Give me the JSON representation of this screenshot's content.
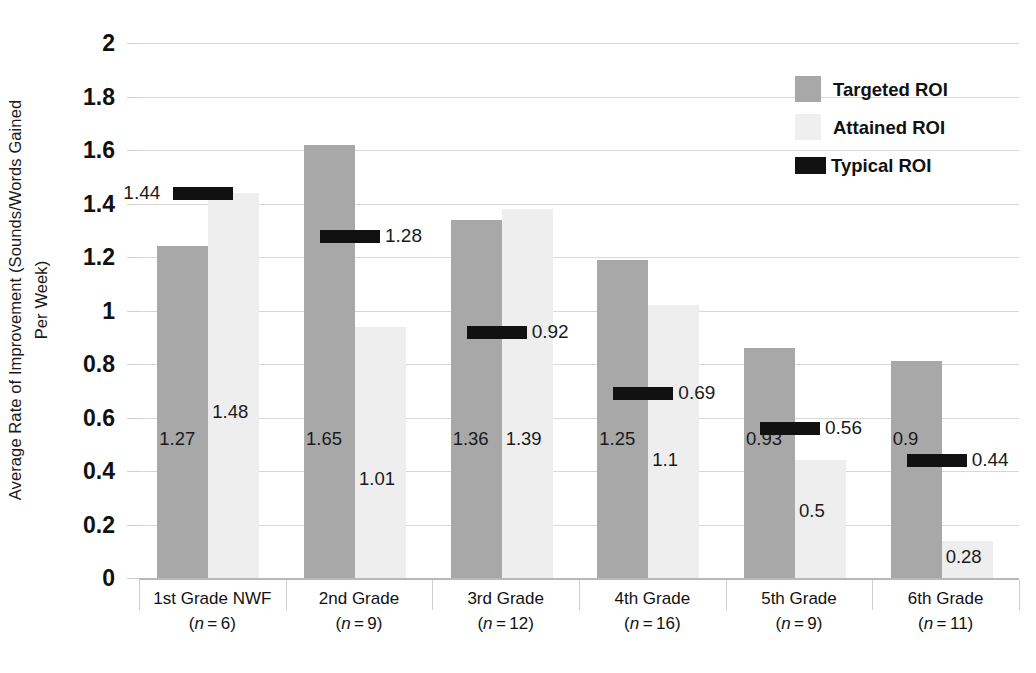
{
  "chart_data": {
    "type": "bar",
    "title": "",
    "subtitle": "",
    "xlabel": "",
    "ylabel_line1": "Average Rate of Improvement (Sounds/Words Gained",
    "ylabel_line2": "Per Week)",
    "ylim": [
      0,
      2
    ],
    "ytick_values": [
      2,
      1.8,
      1.6,
      1.4,
      1.2,
      1,
      0.8,
      0.6,
      0.4,
      0.2,
      0
    ],
    "ytick_labels": [
      "2",
      "1.8",
      "1.6",
      "1.4",
      "1.2",
      "1",
      "0.8",
      "0.6",
      "0.4",
      "0.2",
      "0"
    ],
    "grid": true,
    "legend_position": "top-right",
    "categories": [
      {
        "line1": "1st Grade NWF",
        "n": "6",
        "line2_prefix": "(",
        "line2_var": "n",
        "line2_suffix": " = 6)"
      },
      {
        "line1": "2nd Grade",
        "n": "9",
        "line2_prefix": "(",
        "line2_var": "n",
        "line2_suffix": " = 9)"
      },
      {
        "line1": "3rd Grade",
        "n": "12",
        "line2_prefix": "(",
        "line2_var": "n",
        "line2_suffix": " = 12)"
      },
      {
        "line1": "4th Grade",
        "n": "16",
        "line2_prefix": "(",
        "line2_var": "n",
        "line2_suffix": " = 16)"
      },
      {
        "line1": "5th Grade",
        "n": "9",
        "line2_prefix": "(",
        "line2_var": "n",
        "line2_suffix": " = 9)"
      },
      {
        "line1": "6th Grade",
        "n": "11",
        "line2_prefix": "(",
        "line2_var": "n",
        "line2_suffix": " = 11)"
      }
    ],
    "series": [
      {
        "name": "Targeted ROI",
        "key": "targeted",
        "color": "#a8a8a8",
        "style": "bar",
        "values": [
          1.24,
          1.62,
          1.34,
          1.19,
          0.86,
          0.81
        ],
        "labels": [
          "1.27",
          "1.65",
          "1.36",
          "1.25",
          "0.93",
          "0.9"
        ]
      },
      {
        "name": "Attained ROI",
        "key": "attained",
        "color": "#eeeeee",
        "style": "bar",
        "values": [
          1.44,
          0.94,
          1.38,
          1.02,
          0.44,
          0.14
        ],
        "labels": [
          "1.48",
          "1.01",
          "1.39",
          "1.1",
          "0.5",
          "0.28"
        ]
      },
      {
        "name": "Typical ROI",
        "key": "typical",
        "color": "#111111",
        "style": "marker",
        "values": [
          1.44,
          1.28,
          0.92,
          0.69,
          0.56,
          0.44
        ],
        "labels": [
          "1.44",
          "1.28",
          "0.92",
          "0.69",
          "0.56",
          "0.44"
        ]
      }
    ]
  },
  "legend": {
    "items": [
      {
        "label": "Targeted ROI",
        "swatch": "targeted"
      },
      {
        "label": "Attained ROI",
        "swatch": "attained"
      },
      {
        "label": "Typical ROI",
        "swatch": "typical"
      }
    ]
  }
}
